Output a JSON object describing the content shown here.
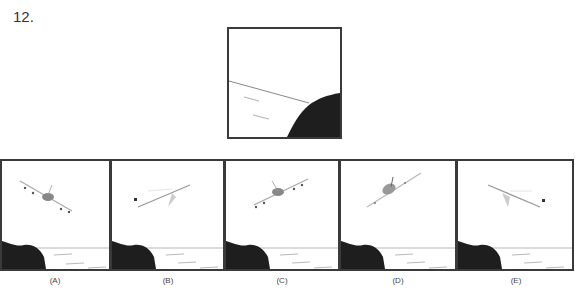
{
  "question": {
    "number": "12."
  },
  "reference": {
    "name": "reference-figure"
  },
  "options": [
    {
      "label": "(A)",
      "plane": "front-view-tilted-left"
    },
    {
      "label": "(B)",
      "plane": "side-view-facing-left"
    },
    {
      "label": "(C)",
      "plane": "front-view-tilted-right"
    },
    {
      "label": "(D)",
      "plane": "front-view-banking"
    },
    {
      "label": "(E)",
      "plane": "side-view-facing-right"
    }
  ],
  "colors": {
    "border": "#3a3a3a",
    "cliff": "#1e1e1e",
    "line": "#888888"
  }
}
